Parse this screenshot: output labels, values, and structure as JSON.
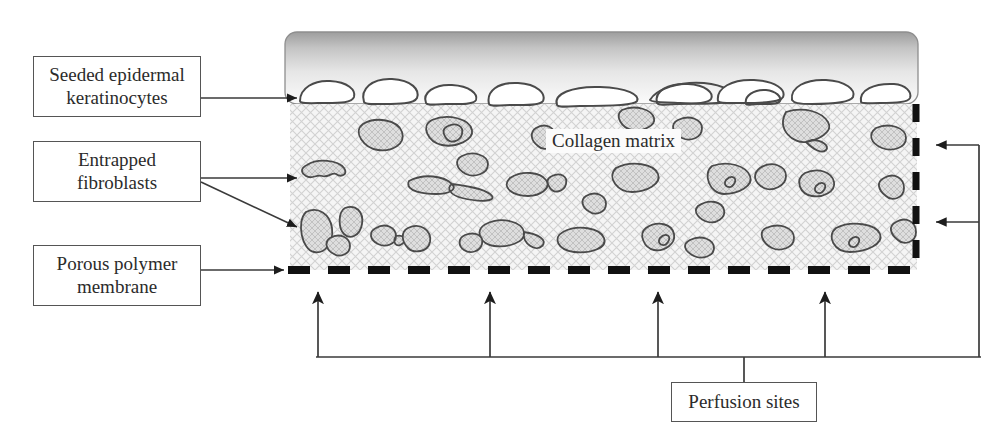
{
  "figure": {
    "type": "biomedical-schematic"
  },
  "labels": {
    "keratinocytes": "Seeded epidermal keratinocytes",
    "keratinocytes_line1": "Seeded epidermal",
    "keratinocytes_line2": "keratinocytes",
    "fibroblasts": "Entrapped fibroblasts",
    "fibroblasts_line1": "Entrapped",
    "fibroblasts_line2": "fibroblasts",
    "membrane": "Porous polymer membrane",
    "membrane_line1": "Porous polymer",
    "membrane_line2": "membrane",
    "perfusion": "Perfusion sites",
    "collagen": "Collagen matrix"
  },
  "colors": {
    "stroke": "#3a3a3a",
    "box_border": "#555555",
    "text": "#2b2b2b",
    "matrix_fill": "#f3f3f3",
    "matrix_hatch": "#cfcfcf",
    "cell_fill": "#d8d8d8",
    "cell_stroke": "#4a4a4a",
    "keratinocyte_fill": "#ffffff",
    "band_top": "#9a9a9a",
    "band_bottom": "#f2f2f2",
    "membrane_dash": "#111111",
    "background": "#ffffff"
  },
  "regions": {
    "epidermal_band": {
      "x": 285,
      "y": 32,
      "width": 633,
      "height": 72,
      "label": "epidermal-gradient-band"
    },
    "collagen_matrix": {
      "x": 290,
      "y": 104,
      "width": 627,
      "height": 166,
      "label": "collagen-matrix-region"
    },
    "membrane_line": {
      "y": 270,
      "x_start": 275,
      "x_end": 918,
      "label": "porous-polymer-membrane-dashed-line"
    }
  },
  "counts": {
    "keratinocytes": 11,
    "fibroblasts": 33,
    "perfusion_arrows_bottom": 4,
    "perfusion_arrows_right": 2
  },
  "connectors": {
    "keratinocyte_arrow": "box right edge -> left end of keratinocyte layer",
    "fibroblast_arrows": "box right edge -> two fibroblasts in matrix",
    "membrane_arrow": "box right edge -> dashed membrane line",
    "perfusion_bottom_arrows_x": [
      318,
      490,
      658,
      825
    ],
    "perfusion_right_arrows_y": [
      145,
      222
    ],
    "perfusion_bus_y": 357,
    "perfusion_bus_x_start": 312,
    "perfusion_bus_x_end": 990,
    "perfusion_drop_x": 744
  }
}
